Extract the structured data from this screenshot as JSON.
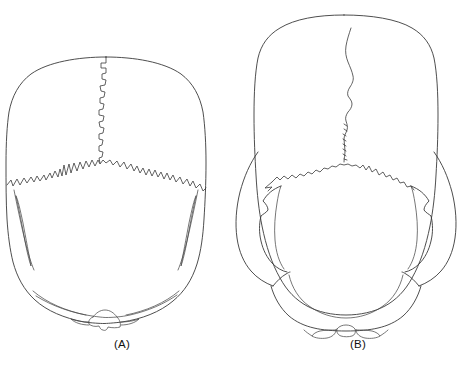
{
  "figure": {
    "kind": "anatomical-line-drawing",
    "background_color": "#ffffff",
    "line_color": "#3a3a3a",
    "panel_count": 2,
    "panels": [
      {
        "id": "A",
        "caption": "(A)",
        "description": "Cranium with narrow, non-flaring zygomatic arches hidden beneath the vault outline (cryptozygy); stepped sagittal suture and deeply serrated coronal suture.",
        "sutures": [
          "sagittal",
          "coronal"
        ],
        "caption_x": 122,
        "caption_y": 344
      },
      {
        "id": "B",
        "caption": "(B)",
        "description": "Cranium with widely flaring zygomatic arches visible outside the vault outline (phaenozygy); finer wavy sagittal suture and gently arched coronal suture.",
        "sutures": [
          "sagittal",
          "coronal"
        ],
        "caption_x": 358,
        "caption_y": 344
      }
    ]
  },
  "labels": {
    "panel_a": "(A)",
    "panel_b": "(B)"
  }
}
